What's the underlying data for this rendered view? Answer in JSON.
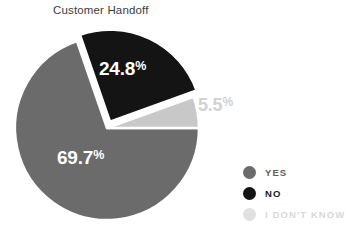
{
  "chart": {
    "title": "Customer Handoff"
  },
  "chart_data": {
    "type": "pie",
    "title": "Customer Handoff",
    "xlabel": "",
    "ylabel": "",
    "unit": "%",
    "legend_position": "right-bottom",
    "grid": false,
    "categories": [
      "YES",
      "NO",
      "I DON'T KNOW"
    ],
    "values": [
      69.7,
      24.8,
      5.5
    ],
    "colors": [
      "#6b6b6b",
      "#141414",
      "#c8c8c8"
    ],
    "slices": [
      {
        "label": "YES",
        "value": 69.7,
        "value_text": "69.7",
        "pct_symbol": "%",
        "color": "#6b6b6b",
        "label_color": "#ffffff",
        "label_inside": true,
        "exploded": false
      },
      {
        "label": "NO",
        "value": 24.8,
        "value_text": "24.8",
        "pct_symbol": "%",
        "color": "#141414",
        "label_color": "#ffffff",
        "label_inside": true,
        "exploded": true
      },
      {
        "label": "I DON'T KNOW",
        "value": 5.5,
        "value_text": "5.5",
        "pct_symbol": "%",
        "color": "#c8c8c8",
        "label_color": "#d2d2d2",
        "label_inside": false,
        "exploded": false
      }
    ]
  },
  "legend": {
    "items": [
      {
        "label": "YES",
        "color": "#6b6b6b"
      },
      {
        "label": "NO",
        "color": "#141414"
      },
      {
        "label": "I DON'T KNOW",
        "color": "#e0e0e0"
      }
    ]
  }
}
